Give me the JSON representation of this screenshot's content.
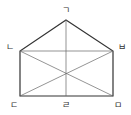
{
  "diagram": {
    "type": "pentagon-with-diagonals",
    "stroke_color": "#333333",
    "thin_stroke_color": "#666666",
    "points": {
      "apex": {
        "label": "ㄱ",
        "x": 66,
        "y": 20
      },
      "left_top": {
        "label": "ㄴ",
        "x": 20,
        "y": 51
      },
      "right_top": {
        "label": "ㅂ",
        "x": 113,
        "y": 51
      },
      "left_bottom": {
        "label": "ㄷ",
        "x": 20,
        "y": 96
      },
      "mid_bottom": {
        "label": "ㄹ",
        "x": 66,
        "y": 96
      },
      "right_bottom": {
        "label": "ㅁ",
        "x": 113,
        "y": 96
      }
    },
    "labels": {
      "g": "ㄱ",
      "n": "ㄴ",
      "b": "ㅂ",
      "d": "ㄷ",
      "r": "ㄹ",
      "m": "ㅁ"
    }
  }
}
